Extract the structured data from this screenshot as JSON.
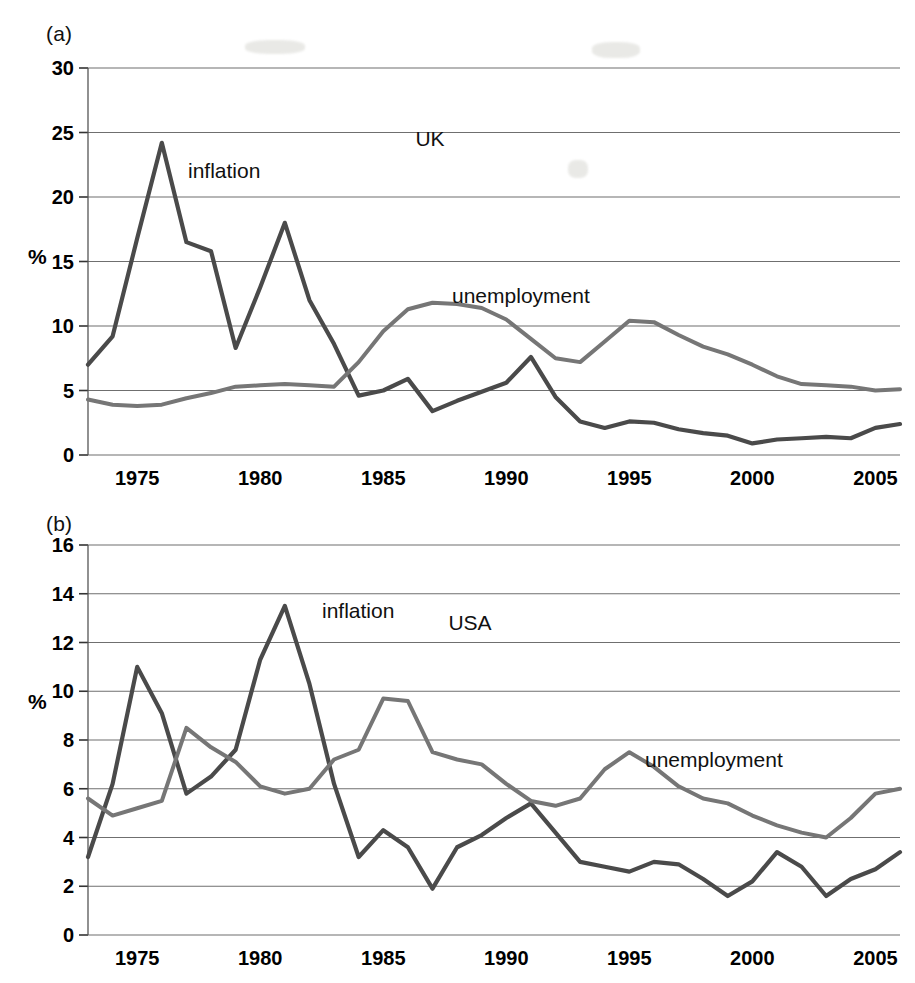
{
  "figure": {
    "background": "#ffffff",
    "inflation_color": "#4a4a4a",
    "unemployment_color": "#767676"
  },
  "panels": [
    {
      "tag": "(a)",
      "region_label": "USA placeholder",
      "y_unit": "%"
    }
  ],
  "panel_a": {
    "tag": "(a)",
    "region_label": "UK",
    "y_unit": "%",
    "inflation_label": "inflation",
    "unemployment_label": "unemployment"
  },
  "panel_b": {
    "tag": "(b)",
    "region_label": "USA",
    "y_unit": "%",
    "inflation_label": "inflation",
    "unemployment_label": "unemployment"
  },
  "chart_data": [
    {
      "type": "line",
      "title": "UK",
      "panel": "(a)",
      "xlabel": "",
      "ylabel": "%",
      "xlim": [
        1973,
        2006
      ],
      "ylim": [
        0,
        30
      ],
      "yticks": [
        0,
        5,
        10,
        15,
        20,
        25,
        30
      ],
      "xticks": [
        1975,
        1980,
        1985,
        1990,
        1995,
        2000,
        2005
      ],
      "grid": true,
      "legend": "inline-annotation",
      "x": [
        1973,
        1974,
        1975,
        1976,
        1977,
        1978,
        1979,
        1980,
        1981,
        1982,
        1983,
        1984,
        1985,
        1986,
        1987,
        1988,
        1989,
        1990,
        1991,
        1992,
        1993,
        1994,
        1995,
        1996,
        1997,
        1998,
        1999,
        2000,
        2001,
        2002,
        2003,
        2004,
        2005,
        2006
      ],
      "series": [
        {
          "name": "inflation",
          "color": "#4a4a4a",
          "values": [
            7.0,
            9.2,
            16.8,
            24.2,
            16.5,
            15.8,
            8.3,
            13.0,
            18.0,
            12.0,
            8.6,
            4.6,
            5.0,
            5.9,
            3.4,
            4.2,
            4.9,
            5.6,
            7.6,
            4.5,
            2.6,
            2.1,
            2.6,
            2.5,
            2.0,
            1.7,
            1.5,
            0.9,
            1.2,
            1.3,
            1.4,
            1.3,
            2.1,
            2.4
          ]
        },
        {
          "name": "unemployment",
          "color": "#767676",
          "values": [
            4.3,
            3.9,
            3.8,
            3.9,
            4.4,
            4.8,
            5.3,
            5.4,
            5.5,
            5.4,
            5.3,
            7.2,
            9.6,
            11.3,
            11.8,
            11.7,
            11.4,
            10.5,
            9.0,
            7.5,
            7.2,
            8.8,
            10.4,
            10.3,
            9.3,
            8.4,
            7.8,
            7.0,
            6.1,
            5.5,
            5.4,
            5.3,
            5.0,
            5.1,
            5.4
          ]
        }
      ]
    },
    {
      "type": "line",
      "title": "USA",
      "panel": "(b)",
      "xlabel": "",
      "ylabel": "%",
      "xlim": [
        1973,
        2006
      ],
      "ylim": [
        0,
        16
      ],
      "yticks": [
        0,
        2,
        4,
        6,
        8,
        10,
        12,
        14,
        16
      ],
      "xticks": [
        1975,
        1980,
        1985,
        1990,
        1995,
        2000,
        2005
      ],
      "grid": true,
      "legend": "inline-annotation",
      "x": [
        1973,
        1974,
        1975,
        1976,
        1977,
        1978,
        1979,
        1980,
        1981,
        1982,
        1983,
        1984,
        1985,
        1986,
        1987,
        1988,
        1989,
        1990,
        1991,
        1992,
        1993,
        1994,
        1995,
        1996,
        1997,
        1998,
        1999,
        2000,
        2001,
        2002,
        2003,
        2004,
        2005,
        2006
      ],
      "series": [
        {
          "name": "inflation",
          "color": "#4a4a4a",
          "values": [
            3.2,
            6.2,
            11.0,
            9.1,
            5.8,
            6.5,
            7.6,
            11.3,
            13.5,
            10.3,
            6.2,
            3.2,
            4.3,
            3.6,
            1.9,
            3.6,
            4.1,
            4.8,
            5.4,
            4.2,
            3.0,
            2.8,
            2.6,
            3.0,
            2.9,
            2.3,
            1.6,
            2.2,
            3.4,
            2.8,
            1.6,
            2.3,
            2.7,
            3.4,
            3.3
          ]
        },
        {
          "name": "unemployment",
          "color": "#767676",
          "values": [
            5.6,
            4.9,
            5.2,
            5.5,
            8.5,
            7.7,
            7.1,
            6.1,
            5.8,
            6.0,
            7.2,
            7.6,
            9.7,
            9.6,
            7.5,
            7.2,
            7.0,
            6.2,
            5.5,
            5.3,
            5.6,
            6.8,
            7.5,
            6.9,
            6.1,
            5.6,
            5.4,
            4.9,
            4.5,
            4.2,
            4.0,
            4.8,
            5.8,
            6.0,
            5.5,
            4.6
          ]
        }
      ]
    }
  ]
}
